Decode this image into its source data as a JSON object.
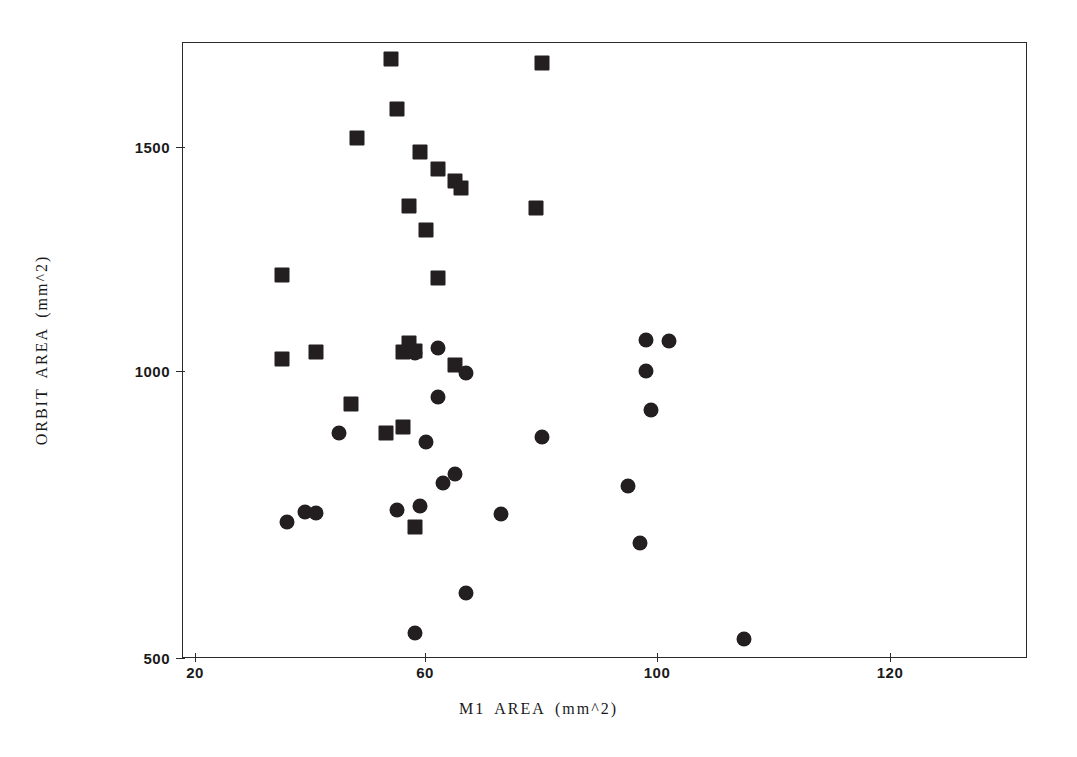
{
  "chart_data": {
    "type": "scatter",
    "title": "",
    "xlabel": "M1 AREA (mm^2)",
    "ylabel": "ORBIT AREA (mm^2)",
    "xlim": [
      20,
      130
    ],
    "ylim": [
      500,
      1700
    ],
    "xticks": [
      20,
      60,
      100,
      120
    ],
    "xtick_labels": [
      "20",
      "60",
      "100",
      "120"
    ],
    "yticks": [
      500,
      1000,
      1500
    ],
    "ytick_labels": [
      "500",
      "1000",
      "1500"
    ],
    "grid": false,
    "legend": null,
    "marker_color": "#231f20",
    "frame_color": "#2b2b2b",
    "series": [
      {
        "name": "square",
        "marker": "square",
        "points": [
          [
            54,
            1673
          ],
          [
            80,
            1665
          ],
          [
            55,
            1574
          ],
          [
            48,
            1518
          ],
          [
            59,
            1490
          ],
          [
            62,
            1457
          ],
          [
            65,
            1434
          ],
          [
            66,
            1420
          ],
          [
            57,
            1385
          ],
          [
            79,
            1381
          ],
          [
            60,
            1337
          ],
          [
            35,
            1249
          ],
          [
            62,
            1244
          ],
          [
            57,
            1117
          ],
          [
            58,
            1100
          ],
          [
            56,
            1098
          ],
          [
            65,
            1073
          ],
          [
            41,
            1098
          ],
          [
            35,
            1086
          ],
          [
            47,
            997
          ],
          [
            56,
            952
          ],
          [
            53,
            941
          ],
          [
            58,
            757
          ]
        ]
      },
      {
        "name": "circle",
        "marker": "circle",
        "points": [
          [
            98,
            1122
          ],
          [
            102,
            1121
          ],
          [
            62,
            1106
          ],
          [
            58,
            1097
          ],
          [
            67,
            1058
          ],
          [
            98,
            1061
          ],
          [
            62,
            1010
          ],
          [
            99,
            985
          ],
          [
            45,
            941
          ],
          [
            80,
            933
          ],
          [
            60,
            923
          ],
          [
            63,
            843
          ],
          [
            65,
            860
          ],
          [
            95,
            836
          ],
          [
            39,
            786
          ],
          [
            41,
            783
          ],
          [
            59,
            798
          ],
          [
            55,
            790
          ],
          [
            36,
            766
          ],
          [
            73,
            781
          ],
          [
            97,
            725
          ],
          [
            67,
            627
          ],
          [
            58,
            549
          ],
          [
            115,
            537
          ]
        ]
      }
    ]
  },
  "axis": {
    "x_title": "M1 AREA (mm^2)",
    "y_title": "ORBIT AREA (mm^2)",
    "x_tick_labels": [
      "20",
      "60",
      "100",
      "120"
    ],
    "y_tick_labels": [
      "500",
      "1000",
      "1500"
    ]
  }
}
